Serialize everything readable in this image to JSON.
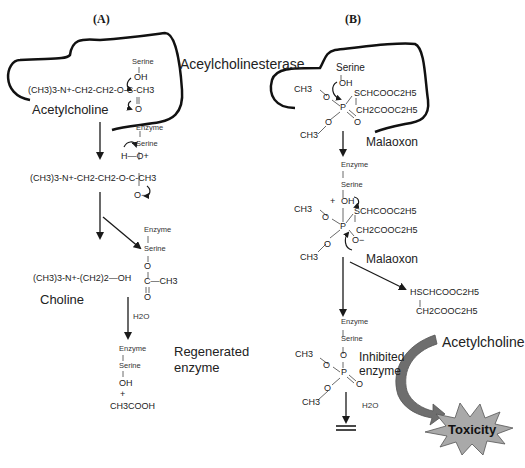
{
  "panels": {
    "a": {
      "label": "(A)",
      "enzyme_label": "Aceylcholinesterase",
      "substrate_name": "Acetylcholine",
      "substrate_formula": "(CH3)3-N+-CH2-CH2-O-C-CH3",
      "serine": "Serine",
      "oh": "OH",
      "carbonyl_o": "O",
      "enzyme": "Enzyme",
      "intermediate_h": "H—O+",
      "intermediate_formula": "(CH3)3-N+-CH2-CH2-O-C-CH3",
      "intermediate_ominus": "O−",
      "choline_formula": "(CH3)3-N+-(CH2)2—OH",
      "choline_name": "Choline",
      "acyl_o": "O",
      "acyl_c": "C—CH3",
      "acyl_o2": "O",
      "water": "H2O",
      "regen_label_1": "Regenerated",
      "regen_label_2": "enzyme",
      "plus": "+",
      "acetic_acid": "CH3COOH"
    },
    "b": {
      "label": "(B)",
      "serine": "Serine",
      "oh": "OH",
      "ch3": "CH3",
      "o": "O",
      "p": "P",
      "sch": "SCHCOOC2H5",
      "ch2": "CH2COOC2H5",
      "malaoxon": "Malaoxon",
      "enzyme": "Enzyme",
      "plus": "+",
      "ominus": "O−",
      "malaoxon2": "Malaoxon",
      "leaving_1": "HSCHCOOC2H5",
      "leaving_2": "CH2COOC2H5",
      "inhibited_1": "Inhibited",
      "inhibited_2": "enzyme",
      "water": "H2O",
      "acetylcholine": "Acetylcholine",
      "toxicity": "Toxicity"
    }
  },
  "colors": {
    "line": "#1a1a1a",
    "curved_arrow": "#6e6e6e",
    "starburst": "#a9a9a9"
  }
}
